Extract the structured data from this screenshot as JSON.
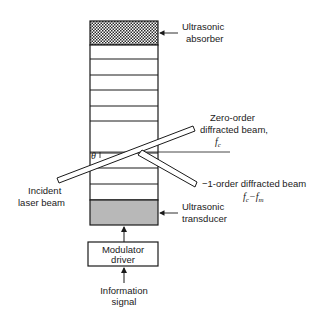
{
  "diagram": {
    "labels": {
      "absorber_line1": "Ultrasonic",
      "absorber_line2": "absorber",
      "zero_order_line1": "Zero-order",
      "zero_order_line2": "diffracted beam,",
      "zero_order_freq": "f",
      "zero_order_freq_sub": "c",
      "minus_one_order": "−1-order diffracted beam",
      "minus_one_freq": "f",
      "minus_one_freq_sub1": "c",
      "minus_one_freq_op": "−f",
      "minus_one_freq_sub2": "m",
      "incident_line1": "Incident",
      "incident_line2": "laser beam",
      "transducer_line1": "Ultrasonic",
      "transducer_line2": "transducer",
      "modulator_line1": "Modulator",
      "modulator_line2": "driver",
      "info_line1": "Information",
      "info_line2": "signal",
      "theta": "θ"
    },
    "colors": {
      "line": "#1a1a1a",
      "transducer_fill": "#b8b8b8",
      "absorber_hatch": "#2a2a2a"
    }
  }
}
